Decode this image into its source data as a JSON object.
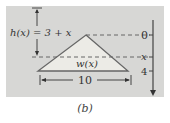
{
  "diagram": {
    "height_label": "h(x) = 3 + x",
    "width_label": "w(x)",
    "base_label": "10",
    "axis_ticks": [
      {
        "label": "0",
        "y": 35
      },
      {
        "label": "x",
        "y": 57
      },
      {
        "label": "4",
        "y": 71
      }
    ],
    "colors": {
      "panel": "#d7d7d5",
      "shape_fill": "#ecebe6",
      "stroke": "#555555"
    }
  },
  "caption": "(b)"
}
